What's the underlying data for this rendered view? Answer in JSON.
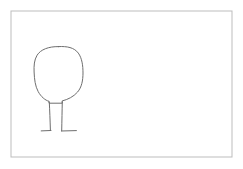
{
  "document": {
    "title": "Hand-drawn tree sketch",
    "kind": "line-drawing",
    "width": 243,
    "height": 169,
    "background_color": "#ffffff"
  },
  "frame": {
    "name": "border-frame",
    "x": 11,
    "y": 11,
    "width": 221,
    "height": 146,
    "stroke_color": "#bdbdbd",
    "stroke_width": 1,
    "fill_color": "#ffffff"
  },
  "drawing": {
    "label": "tree",
    "stroke_color": "#6e6e6e",
    "stroke_width": 1,
    "parts": [
      {
        "name": "canopy",
        "description": "rounded blob crown of the tree",
        "path": "M 58.5 46.6 C 48.5 46.4 40.6 49.6 37.1 55.2 C 34.2 59.9 33.8 65.8 34.1 72.0 C 34.4 79.2 35.2 86.2 38.2 91.6 C 41.0 96.7 45.2 100.3 49.0 101.3 L 49.0 103.2 L 62.2 103.2 L 62.2 100.9 C 67.6 99.6 73.5 96.8 77.6 92.0 C 81.7 87.2 83.0 80.4 83.0 73.0 C 83.0 65.6 82.0 58.2 78.3 53.1 C 74.2 47.5 67.0 46.1 58.5 46.6 Z"
      },
      {
        "name": "trunk-left-line",
        "description": "left vertical trunk stroke",
        "path": "M 49.3 102.0 C 49.7 110.0 50.1 120.0 50.4 130.6"
      },
      {
        "name": "trunk-right-line",
        "description": "right vertical trunk stroke",
        "path": "M 62.3 101.8 C 62.1 110.0 61.9 120.5 61.7 130.8"
      },
      {
        "name": "ground-left-line",
        "description": "short horizontal base stroke at foot of left trunk line",
        "path": "M 41.2 130.9 L 51.0 130.5"
      },
      {
        "name": "ground-right-line",
        "description": "short horizontal base stroke at foot of right trunk line",
        "path": "M 61.4 131.0 L 76.4 130.6"
      }
    ]
  }
}
